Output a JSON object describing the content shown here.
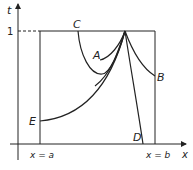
{
  "diagram": {
    "axes": {
      "vertical_label": "t",
      "horizontal_label": "x",
      "tick_t": "1"
    },
    "boundaries": {
      "left": "x = a",
      "right": "x = b"
    },
    "curves": [
      {
        "id": "A",
        "label": "A"
      },
      {
        "id": "B",
        "label": "B"
      },
      {
        "id": "C",
        "label": "C"
      },
      {
        "id": "D",
        "label": "D"
      },
      {
        "id": "E",
        "label": "E"
      }
    ],
    "colors": {
      "line": "#222222",
      "background": "#ffffff"
    }
  }
}
